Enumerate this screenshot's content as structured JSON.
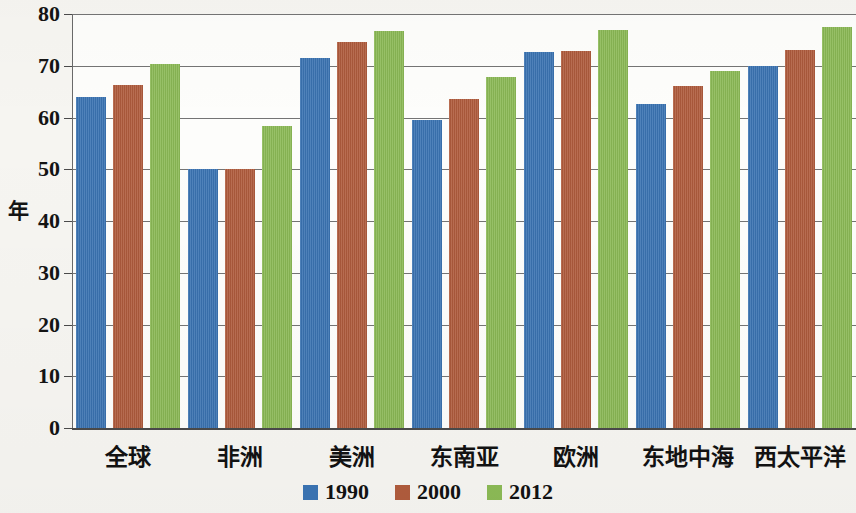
{
  "chart_data": {
    "type": "bar",
    "title": "",
    "subtitle": "",
    "xlabel": "",
    "ylabel": "年",
    "ylim": [
      0,
      80
    ],
    "ytick_step": 10,
    "yticks": [
      80,
      70,
      60,
      50,
      40,
      30,
      20,
      10,
      0
    ],
    "grid": true,
    "legend_position": "bottom-center",
    "categories": [
      "全球",
      "非洲",
      "美洲",
      "东南亚",
      "欧洲",
      "东地中海",
      "西太平洋"
    ],
    "series": [
      {
        "name": "1990",
        "color": "#3b74b3",
        "values": [
          64.0,
          50.0,
          71.5,
          59.5,
          72.6,
          62.7,
          70.0
        ]
      },
      {
        "name": "2000",
        "color": "#b05c3d",
        "values": [
          66.3,
          50.0,
          74.5,
          63.6,
          72.8,
          66.0,
          73.0
        ]
      },
      {
        "name": "2012",
        "color": "#8cba56",
        "values": [
          70.4,
          58.3,
          76.8,
          67.9,
          77.0,
          69.0,
          77.4
        ]
      }
    ]
  },
  "legend": {
    "items": [
      {
        "label": "1990",
        "color": "#3b74b3"
      },
      {
        "label": "2000",
        "color": "#b05c3d"
      },
      {
        "label": "2012",
        "color": "#8cba56"
      }
    ]
  },
  "axis": {
    "y_title": "年",
    "y_labels": [
      "80",
      "70",
      "60",
      "50",
      "40",
      "30",
      "20",
      "10",
      "0"
    ]
  },
  "colors": {
    "series_1990": "#3b74b3",
    "series_2000": "#b05c3d",
    "series_2012": "#8cba56",
    "gridline": "#5c5c5c",
    "text": "#121212",
    "page_background": "#f6f5f1",
    "plot_background": "#fdfdfb"
  }
}
